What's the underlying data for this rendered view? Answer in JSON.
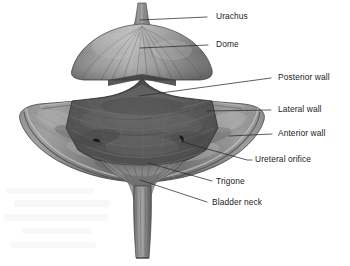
{
  "figure": {
    "background_color": "#ffffff",
    "width": 350,
    "height": 266
  },
  "colors": {
    "label_text": "#1b1b1b",
    "leader_line": "#2a2a2a",
    "dome_light": "#a8a8a8",
    "dome_mid": "#8d8d8d",
    "dome_dark": "#6e6e6e",
    "cavity_dark": "#575757",
    "cavity_mid": "#636363",
    "wall_flap": "#8a8a8a",
    "wall_flap_shadow": "#6a6a6a",
    "trigone": "#707070",
    "urethra": "#787878",
    "outline": "#3a3a3a",
    "watermark": "#f2f2f2"
  },
  "labels": [
    {
      "id": "urachus",
      "text": "Urachus",
      "text_x": 216,
      "text_y": 17,
      "line": "M140,20 L207,17"
    },
    {
      "id": "dome",
      "text": "Dome",
      "text_x": 216,
      "text_y": 45,
      "line": "M140,48 L208,45"
    },
    {
      "id": "posterior-wall",
      "text": "Posterior wall",
      "text_x": 278,
      "text_y": 78,
      "line": "M139,96 L271,78"
    },
    {
      "id": "lateral-wall",
      "text": "Lateral wall",
      "text_x": 278,
      "text_y": 110,
      "line": "M207,111 L271,110"
    },
    {
      "id": "anterior-wall",
      "text": "Anterior wall",
      "text_x": 278,
      "text_y": 134,
      "line": "M229,136 L272,134"
    },
    {
      "id": "ureteral-orifice",
      "text": "Ureteral orifice",
      "text_x": 255,
      "text_y": 160,
      "line": "M182,139 L186,143 L247,160 L252,160"
    },
    {
      "id": "trigone",
      "text": "Trigone",
      "text_x": 216,
      "text_y": 182,
      "line": "M148,163 L212,181"
    },
    {
      "id": "bladder-neck",
      "text": "Bladder neck",
      "text_x": 212,
      "text_y": 203,
      "line": "M140,180 L207,202"
    }
  ],
  "structures": [
    {
      "id": "urachus-stalk",
      "name": "Urachus stalk"
    },
    {
      "id": "dome-body",
      "name": "Dome"
    },
    {
      "id": "left-wall-flap",
      "name": "Left cut wall flap"
    },
    {
      "id": "right-wall-flap",
      "name": "Right cut wall flap"
    },
    {
      "id": "bladder-cavity",
      "name": "Bladder lumen"
    },
    {
      "id": "trigone-region",
      "name": "Trigone"
    },
    {
      "id": "left-orifice",
      "name": "Left ureteral orifice"
    },
    {
      "id": "right-orifice",
      "name": "Right ureteral orifice"
    },
    {
      "id": "bladder-neck-region",
      "name": "Bladder neck"
    },
    {
      "id": "urethra-stem",
      "name": "Urethra"
    }
  ]
}
